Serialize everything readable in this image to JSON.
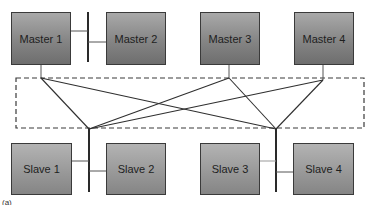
{
  "diagram": {
    "masters": [
      {
        "label": "Master 1"
      },
      {
        "label": "Master 2"
      },
      {
        "label": "Master 3"
      },
      {
        "label": "Master 4"
      }
    ],
    "slaves": [
      {
        "label": "Slave 1"
      },
      {
        "label": "Slave 2"
      },
      {
        "label": "Slave 3"
      },
      {
        "label": "Slave 4"
      }
    ],
    "interconnect": {
      "style": "dashed-box",
      "connections": [
        [
          "Master 1",
          "Slave bus 1"
        ],
        [
          "Master 1",
          "Slave bus 2"
        ],
        [
          "Master 3",
          "Slave bus 1"
        ],
        [
          "Master 3",
          "Slave bus 2"
        ],
        [
          "Master 4",
          "Slave bus 1"
        ],
        [
          "Master 4",
          "Slave bus 2"
        ]
      ]
    },
    "caption": "(a)"
  },
  "colors": {
    "box_top": "#a9a9a9",
    "box_bottom": "#6e6e6e",
    "line": "#3a3a3a"
  }
}
